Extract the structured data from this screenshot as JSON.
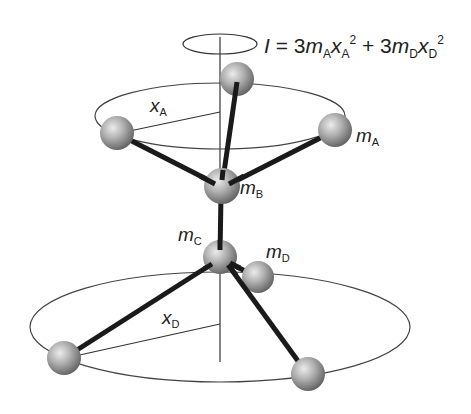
{
  "diagram": {
    "equation": {
      "lhs": "I",
      "eq": " = 3",
      "term1_m": "m",
      "term1_m_sub": "A",
      "term1_x": "x",
      "term1_x_sub": "A",
      "term1_sup": "2",
      "plus": " + 3",
      "term2_m": "m",
      "term2_m_sub": "D",
      "term2_x": "x",
      "term2_x_sub": "D",
      "term2_sup": "2"
    },
    "labels": {
      "mA": {
        "base": "m",
        "sub": "A"
      },
      "mB": {
        "base": "m",
        "sub": "B"
      },
      "mC": {
        "base": "m",
        "sub": "C"
      },
      "mD": {
        "base": "m",
        "sub": "D"
      },
      "xA": {
        "base": "x",
        "sub": "A"
      },
      "xD": {
        "base": "x",
        "sub": "D"
      }
    },
    "colors": {
      "line": "#1a1a1a",
      "thin_line": "#444444",
      "sphere_light": "#e6e6e6",
      "sphere_mid": "#a8a8a8",
      "sphere_dark": "#5a5a5a"
    }
  }
}
